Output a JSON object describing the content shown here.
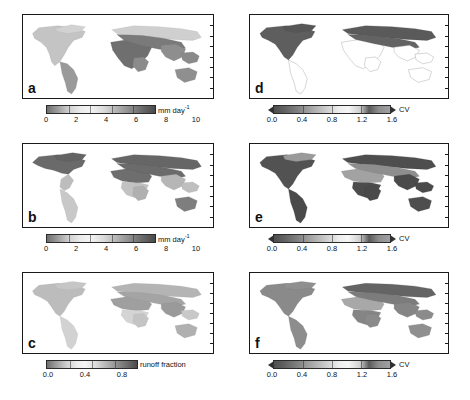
{
  "figure": {
    "layout": "2 columns x 3 rows of world maps, each with a horizontal grayscale colorbar beneath",
    "caption": ""
  },
  "chart_data": {
    "type": "heatmap",
    "projection": "equirectangular world map, land-only shaded, ocean white",
    "grid": false,
    "legend_position": "below each panel",
    "panels": [
      {
        "id": "a",
        "label": "a",
        "column": "left",
        "row": 1,
        "variable": "precipitation",
        "colorbar": {
          "unit_label": "mm day",
          "unit_exponent": "-1",
          "unit_full": "mm day-1",
          "ticks": [
            "0",
            "2",
            "4",
            "6",
            "8",
            "10"
          ],
          "tick_values": [
            0,
            2,
            4,
            6,
            8,
            10
          ],
          "vmin": 0,
          "vmax": 10,
          "arrow_caps": false,
          "colormap": "grayscale-banded"
        },
        "regions": [
          {
            "name": "Sahara",
            "value": 9.5,
            "shade": "dark"
          },
          {
            "name": "Arabian Peninsula",
            "value": 9.5,
            "shade": "dark"
          },
          {
            "name": "Central Asia",
            "value": 8.5,
            "shade": "dark"
          },
          {
            "name": "Amazon Basin",
            "value": 5.5,
            "shade": "medium"
          },
          {
            "name": "Congo Basin",
            "value": 5.5,
            "shade": "medium"
          },
          {
            "name": "Southeast Asia",
            "value": 6.0,
            "shade": "medium"
          },
          {
            "name": "Northern North America",
            "value": 3.0,
            "shade": "light"
          },
          {
            "name": "Northern Eurasia",
            "value": 3.0,
            "shade": "light"
          },
          {
            "name": "Australia interior",
            "value": 7.5,
            "shade": "medium-dark"
          }
        ]
      },
      {
        "id": "b",
        "label": "b",
        "column": "left",
        "row": 2,
        "variable": "evapotranspiration",
        "colorbar": {
          "unit_label": "mm day",
          "unit_exponent": "-1",
          "unit_full": "mm day-1",
          "ticks": [
            "0",
            "2",
            "4",
            "6",
            "8",
            "10"
          ],
          "tick_values": [
            0,
            2,
            4,
            6,
            8,
            10
          ],
          "vmin": 0,
          "vmax": 10,
          "arrow_caps": false,
          "colormap": "grayscale-banded"
        },
        "regions": [
          {
            "name": "Northern North America",
            "value": 9.0,
            "shade": "dark"
          },
          {
            "name": "Northern Eurasia",
            "value": 9.0,
            "shade": "dark"
          },
          {
            "name": "Sahara",
            "value": 8.5,
            "shade": "dark"
          },
          {
            "name": "Amazon Basin",
            "value": 3.5,
            "shade": "light"
          },
          {
            "name": "Congo Basin",
            "value": 3.5,
            "shade": "light"
          },
          {
            "name": "Southeast Asia",
            "value": 3.0,
            "shade": "light"
          },
          {
            "name": "Australia",
            "value": 7.0,
            "shade": "medium-dark"
          }
        ]
      },
      {
        "id": "c",
        "label": "c",
        "column": "left",
        "row": 3,
        "variable": "runoff fraction",
        "colorbar": {
          "unit_label": "runoff fraction",
          "unit_exponent": "",
          "unit_full": "runoff fraction",
          "ticks": [
            "0.0",
            "0.4",
            "0.8"
          ],
          "tick_values": [
            0.0,
            0.4,
            0.8
          ],
          "vmin": 0.0,
          "vmax": 1.0,
          "arrow_caps": false,
          "colormap": "grayscale-banded"
        },
        "regions": [
          {
            "name": "Northern high latitudes",
            "value": 0.55,
            "shade": "medium"
          },
          {
            "name": "Sahara",
            "value": 0.5,
            "shade": "medium"
          },
          {
            "name": "Tibetan Plateau",
            "value": 0.6,
            "shade": "medium-dark"
          },
          {
            "name": "Amazon Basin",
            "value": 0.35,
            "shade": "light"
          },
          {
            "name": "Congo Basin",
            "value": 0.3,
            "shade": "light"
          },
          {
            "name": "Eastern North America",
            "value": 0.25,
            "shade": "light"
          }
        ]
      },
      {
        "id": "d",
        "label": "d",
        "column": "right",
        "row": 1,
        "variable": "coefficient of variation of precipitation",
        "colorbar": {
          "unit_label": "CV",
          "unit_exponent": "",
          "unit_full": "CV",
          "ticks": [
            "0.0",
            "0.4",
            "0.8",
            "1.2",
            "1.6"
          ],
          "tick_values": [
            0.0,
            0.4,
            0.8,
            1.2,
            1.6
          ],
          "vmin": 0.0,
          "vmax": 1.6,
          "arrow_caps": true,
          "colormap": "grayscale-banded"
        },
        "regions": [
          {
            "name": "Northern North America",
            "value": 1.5,
            "shade": "dark"
          },
          {
            "name": "Northern Eurasia",
            "value": 1.5,
            "shade": "dark"
          },
          {
            "name": "Greenland margin",
            "value": 1.4,
            "shade": "dark"
          },
          {
            "name": "South America",
            "value": 0.1,
            "shade": "white"
          },
          {
            "name": "Africa",
            "value": 0.15,
            "shade": "white"
          },
          {
            "name": "Australia",
            "value": 0.2,
            "shade": "white"
          },
          {
            "name": "India",
            "value": 0.2,
            "shade": "white"
          }
        ]
      },
      {
        "id": "e",
        "label": "e",
        "column": "right",
        "row": 2,
        "variable": "coefficient of variation of evapotranspiration",
        "colorbar": {
          "unit_label": "CV",
          "unit_exponent": "",
          "unit_full": "CV",
          "ticks": [
            "0.0",
            "0.4",
            "0.8",
            "1.2",
            "1.6"
          ],
          "tick_values": [
            0.0,
            0.4,
            0.8,
            1.2,
            1.6
          ],
          "vmin": 0.0,
          "vmax": 1.6,
          "arrow_caps": true,
          "colormap": "grayscale-banded"
        },
        "regions": [
          {
            "name": "Most land areas",
            "value": 1.4,
            "shade": "dark"
          },
          {
            "name": "Sahara",
            "value": 0.7,
            "shade": "medium"
          },
          {
            "name": "Arabian Peninsula",
            "value": 0.7,
            "shade": "medium"
          },
          {
            "name": "Central Asia",
            "value": 0.8,
            "shade": "medium"
          },
          {
            "name": "Northern North America",
            "value": 0.9,
            "shade": "medium"
          }
        ]
      },
      {
        "id": "f",
        "label": "f",
        "column": "right",
        "row": 3,
        "variable": "coefficient of variation of runoff fraction",
        "colorbar": {
          "unit_label": "CV",
          "unit_exponent": "",
          "unit_full": "CV",
          "ticks": [
            "0.0",
            "0.4",
            "0.8",
            "1.2",
            "1.6"
          ],
          "tick_values": [
            0.0,
            0.4,
            0.8,
            1.2,
            1.6
          ],
          "vmin": 0.0,
          "vmax": 1.6,
          "arrow_caps": true,
          "colormap": "grayscale-banded"
        },
        "regions": [
          {
            "name": "Northern Eurasia",
            "value": 1.2,
            "shade": "medium-dark"
          },
          {
            "name": "Northern North America",
            "value": 1.0,
            "shade": "medium"
          },
          {
            "name": "Amazon Basin",
            "value": 0.8,
            "shade": "medium"
          },
          {
            "name": "Congo Basin",
            "value": 0.8,
            "shade": "medium"
          },
          {
            "name": "Sahara",
            "value": 0.6,
            "shade": "medium-light"
          },
          {
            "name": "Australia",
            "value": 0.7,
            "shade": "medium"
          }
        ]
      }
    ],
    "colors": {
      "frame": "#1a1a1a",
      "ocean": "#ffffff",
      "text": "#111111",
      "ramp_dark": "#3a3a3a",
      "ramp_light": "#f2f2f2"
    }
  }
}
